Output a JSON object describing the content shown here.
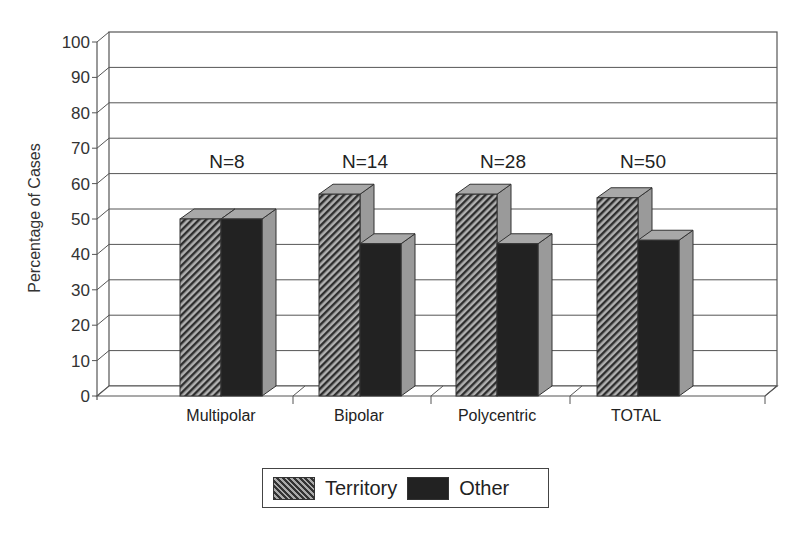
{
  "chart_data": {
    "type": "bar",
    "style": "3d-clustered",
    "title": "",
    "xlabel": "",
    "ylabel": "Percentage of Cases",
    "ylim": [
      0,
      100
    ],
    "yticks": [
      0,
      10,
      20,
      30,
      40,
      50,
      60,
      70,
      80,
      90,
      100
    ],
    "grid": true,
    "legend_position": "bottom",
    "categories": [
      "Multipolar",
      "Bipolar",
      "Polycentric",
      "TOTAL"
    ],
    "annotations": [
      "N=8",
      "N=14",
      "N=28",
      "N=50"
    ],
    "series": [
      {
        "name": "Territory",
        "pattern": "diagonal-hatch",
        "values": [
          50,
          57,
          57,
          56
        ]
      },
      {
        "name": "Other",
        "pattern": "solid-dark",
        "values": [
          50,
          43,
          43,
          44
        ]
      }
    ]
  },
  "legend": {
    "items": [
      {
        "label": "Territory"
      },
      {
        "label": "Other"
      }
    ]
  },
  "colors": {
    "territory_dark": "#333333",
    "territory_light": "#aaaaaa",
    "other": "#222222",
    "bar_side": "#9a9a9a",
    "bar_top": "#a8a8a8",
    "grid": "#555555"
  }
}
